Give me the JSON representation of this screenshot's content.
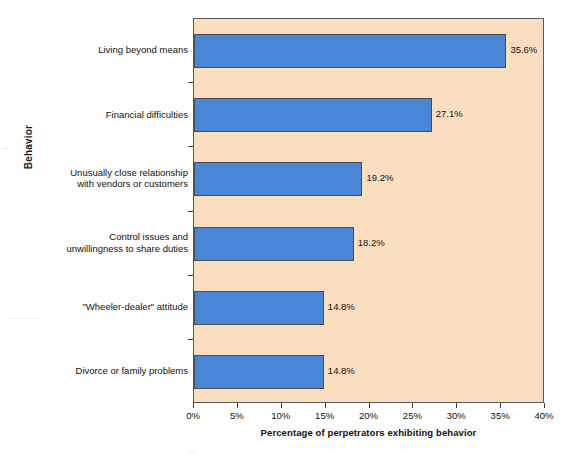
{
  "chart_data": {
    "type": "bar",
    "orientation": "horizontal",
    "title": "",
    "xlabel": "Percentage of perpetrators exhibiting behavior",
    "ylabel": "Behavior",
    "categories": [
      "Living beyond means",
      "Financial difficulties",
      "Unusually close relationship\nwith vendors or customers",
      "Control issues and\nunwillingness to share duties",
      "\"Wheeler-dealer\" attitude",
      "Divorce or family problems"
    ],
    "values": [
      35.6,
      27.1,
      19.2,
      18.2,
      14.8,
      14.8
    ],
    "value_labels": [
      "35.6%",
      "27.1%",
      "19.2%",
      "18.2%",
      "14.8%",
      "14.8%"
    ],
    "xlim": [
      0,
      40
    ],
    "xticks": [
      0,
      5,
      10,
      15,
      20,
      25,
      30,
      35,
      40
    ],
    "xtick_labels": [
      "0%",
      "5%",
      "10%",
      "15%",
      "20%",
      "25%",
      "30%",
      "35%",
      "40%"
    ],
    "grid": false,
    "legend": null,
    "colors": {
      "bar_fill": "#4a86d8",
      "bar_border": "#4b4b4b",
      "plot_background": "#f9dfc0",
      "page_background": "#ffffff",
      "text": "#111111",
      "axis": "#595959"
    }
  }
}
